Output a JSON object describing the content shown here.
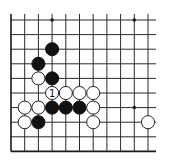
{
  "diagram": {
    "type": "go-board-fragment",
    "grid": {
      "cols": 11,
      "rows": 10,
      "origin_x": 11,
      "origin_y": 20,
      "spacing_x": 13.7,
      "spacing_y": 14.6,
      "open_top": true,
      "open_right": true,
      "left_edge": true,
      "bottom_edge": true
    },
    "star_points": [
      {
        "col": 3,
        "row": 0
      },
      {
        "col": 9,
        "row": 0
      },
      {
        "col": 9,
        "row": 6
      }
    ],
    "stones": [
      {
        "color": "black",
        "col": 3,
        "row": 2
      },
      {
        "color": "black",
        "col": 2,
        "row": 3
      },
      {
        "color": "white",
        "col": 2,
        "row": 4
      },
      {
        "color": "black",
        "col": 3,
        "row": 4
      },
      {
        "color": "white",
        "col": 3,
        "row": 5,
        "label": "1"
      },
      {
        "color": "white",
        "col": 4,
        "row": 5
      },
      {
        "color": "white",
        "col": 5,
        "row": 5
      },
      {
        "color": "white",
        "col": 6,
        "row": 5
      },
      {
        "color": "white",
        "col": 1,
        "row": 6
      },
      {
        "color": "white",
        "col": 2,
        "row": 6
      },
      {
        "color": "black",
        "col": 3,
        "row": 6
      },
      {
        "color": "black",
        "col": 4,
        "row": 6
      },
      {
        "color": "black",
        "col": 5,
        "row": 6
      },
      {
        "color": "white",
        "col": 6,
        "row": 6
      },
      {
        "color": "white",
        "col": 1,
        "row": 7
      },
      {
        "color": "black",
        "col": 2,
        "row": 7
      },
      {
        "color": "white",
        "col": 6,
        "row": 7
      },
      {
        "color": "white",
        "col": 10,
        "row": 7
      }
    ],
    "colors": {
      "black_stone": "#111111",
      "white_stone": "#ffffff",
      "line": "#2a2a2a",
      "background": "#ffffff"
    }
  }
}
